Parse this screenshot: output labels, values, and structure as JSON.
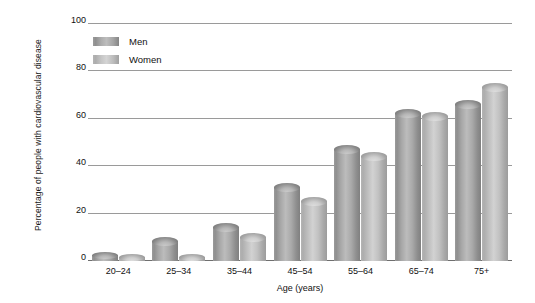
{
  "chart_data": {
    "type": "bar",
    "title": "",
    "xlabel": "Age (years)",
    "ylabel": "Percentage of people with cardiovascular disease",
    "categories": [
      "20–24",
      "25–34",
      "35–44",
      "45–54",
      "55–64",
      "65–74",
      "75+"
    ],
    "series": [
      {
        "name": "Men",
        "values": [
          4,
          10,
          16,
          33,
          49,
          64,
          68
        ],
        "color": "#a0a0a0"
      },
      {
        "name": "Women",
        "values": [
          3,
          3,
          12,
          27,
          46,
          63,
          75
        ],
        "color": "#c0c0c0"
      }
    ],
    "ylim": [
      0,
      100
    ],
    "yticks": [
      0,
      20,
      40,
      60,
      80,
      100
    ],
    "ytick_labels": [
      "0",
      "20",
      "40",
      "60",
      "80",
      "100"
    ],
    "grid": true,
    "legend_position": "top-left"
  },
  "axes": {
    "y_title": "Percentage of people with cardiovascular disease",
    "x_title": "Age (years)"
  },
  "legend": {
    "items": [
      {
        "label": "Men",
        "swatch": "men-swatch"
      },
      {
        "label": "Women",
        "swatch": "women-swatch"
      }
    ]
  },
  "colors": {
    "gridline": "#9a9a9a",
    "axis": "#6f6f6f",
    "text": "#111111",
    "background": "#ffffff"
  }
}
